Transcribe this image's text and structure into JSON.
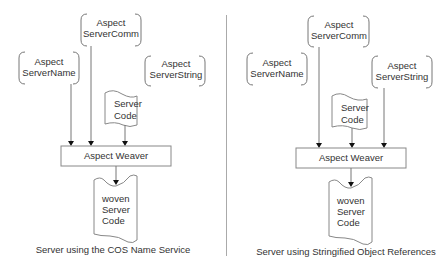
{
  "panels": [
    {
      "caption": "Server using the COS Name Service",
      "aspects": {
        "server_comm": [
          "Aspect",
          "ServerComm"
        ],
        "server_name": [
          "Aspect",
          "ServerName"
        ],
        "server_string": [
          "Aspect",
          "ServerString"
        ]
      },
      "server_code": [
        "Server",
        "Code"
      ],
      "weaver": "Aspect Weaver",
      "woven": [
        "woven",
        "Server",
        "Code"
      ],
      "inputs_to_weaver": [
        "ServerName",
        "ServerComm",
        "Server Code"
      ]
    },
    {
      "caption": "Server using Stringified Object References",
      "aspects": {
        "server_comm": [
          "Aspect",
          "ServerComm"
        ],
        "server_name": [
          "Aspect",
          "ServerName"
        ],
        "server_string": [
          "Aspect",
          "ServerString"
        ]
      },
      "server_code": [
        "Server",
        "Code"
      ],
      "weaver": "Aspect Weaver",
      "woven": [
        "woven",
        "Server",
        "Code"
      ],
      "inputs_to_weaver": [
        "ServerComm",
        "Server Code",
        "ServerString"
      ]
    }
  ]
}
